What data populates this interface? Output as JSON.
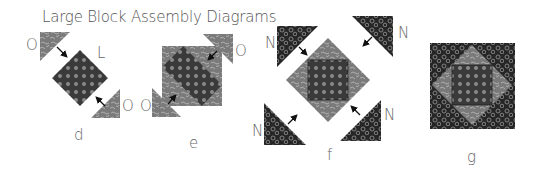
{
  "title": "Large Block Assembly Diagrams",
  "colors": {
    "dark_fabric": "#2a2a2a",
    "dark_dot_fabric": "#3a3a3a",
    "dot": "#8a8a8a",
    "gray_fabric": "#7a7a7a",
    "swirl": "#bdbdbd",
    "label": "#666666",
    "arrow": "#111111"
  },
  "diagrams": [
    {
      "id": "d",
      "caption": "d",
      "piece_labels": [
        "O",
        "L",
        "O"
      ]
    },
    {
      "id": "e",
      "caption": "e",
      "piece_labels": [
        "O",
        "O"
      ]
    },
    {
      "id": "f",
      "caption": "f",
      "piece_labels": [
        "N",
        "N",
        "N",
        "N"
      ]
    },
    {
      "id": "g",
      "caption": "g",
      "piece_labels": []
    }
  ]
}
